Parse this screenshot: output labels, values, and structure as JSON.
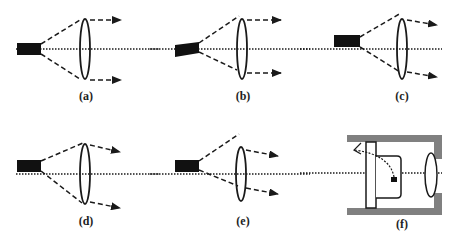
{
  "figure": {
    "colors": {
      "stroke": "#1a1a1a",
      "laser_body": "#111111",
      "housing": "#808080",
      "background": "#ffffff"
    },
    "panels": [
      {
        "id": "a",
        "label": "(a)",
        "config": "laser on-axis, collimated beams"
      },
      {
        "id": "b",
        "label": "(b)",
        "config": "laser tilted, collimated beams"
      },
      {
        "id": "c",
        "label": "(c)",
        "config": "laser offset above axis, beams diverging"
      },
      {
        "id": "d",
        "label": "(d)",
        "config": "laser offset above axis, beams diverging downward"
      },
      {
        "id": "e",
        "label": "(e)",
        "config": "laser offset and tilted, beams diverging"
      },
      {
        "id": "f",
        "label": "(f)",
        "config": "laser mount in housing with lens"
      }
    ]
  }
}
